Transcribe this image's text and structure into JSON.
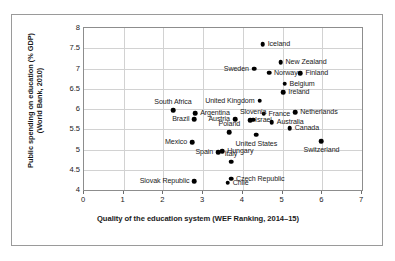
{
  "chart_data": {
    "type": "scatter",
    "title": "",
    "xlabel": "Quality of the education system (WEF Ranking, 2014–15)",
    "ylabel_line1": "Public spending on education (% GDP)",
    "ylabel_line2": "(World Bank, 2010)",
    "xlim": [
      0,
      7
    ],
    "ylim": [
      4,
      8
    ],
    "xticks": [
      "0",
      "1",
      "2",
      "3",
      "4",
      "5",
      "6",
      "7"
    ],
    "yticks": [
      "4",
      "4.5",
      "5",
      "5.5",
      "6",
      "6.5",
      "7",
      "7.5",
      "8"
    ],
    "grid": "both",
    "legend": "none",
    "point_color": "#000000",
    "points": [
      {
        "label": "Iceland",
        "x": 4.5,
        "y": 7.6,
        "pos": "right"
      },
      {
        "label": "Sweden",
        "x": 4.28,
        "y": 7.0,
        "pos": "left"
      },
      {
        "label": "New Zealand",
        "x": 4.95,
        "y": 7.15,
        "pos": "right"
      },
      {
        "label": "Norway",
        "x": 4.66,
        "y": 6.9,
        "pos": "right"
      },
      {
        "label": "Finland",
        "x": 5.45,
        "y": 6.88,
        "pos": "right"
      },
      {
        "label": "Belgium",
        "x": 5.05,
        "y": 6.62,
        "pos": "right"
      },
      {
        "label": "Ireland",
        "x": 5.02,
        "y": 6.42,
        "pos": "right"
      },
      {
        "label": "United Kingdom",
        "x": 4.42,
        "y": 6.2,
        "pos": "left"
      },
      {
        "label": "Netherlands",
        "x": 5.32,
        "y": 5.92,
        "pos": "right"
      },
      {
        "label": "France",
        "x": 4.52,
        "y": 5.88,
        "pos": "right"
      },
      {
        "label": "Slovenia",
        "x": 4.26,
        "y": 5.74,
        "pos": "above"
      },
      {
        "label": "South Africa",
        "x": 2.24,
        "y": 5.97,
        "pos": "above"
      },
      {
        "label": "Argentina",
        "x": 2.8,
        "y": 5.9,
        "pos": "right"
      },
      {
        "label": "Brazil",
        "x": 2.78,
        "y": 5.75,
        "pos": "left"
      },
      {
        "label": "Austria",
        "x": 3.8,
        "y": 5.75,
        "pos": "left"
      },
      {
        "label": "Israel",
        "x": 4.18,
        "y": 5.72,
        "pos": "right"
      },
      {
        "label": "Australia",
        "x": 4.73,
        "y": 5.68,
        "pos": "right"
      },
      {
        "label": "Canada",
        "x": 5.18,
        "y": 5.52,
        "pos": "right"
      },
      {
        "label": "Mexico",
        "x": 2.72,
        "y": 5.18,
        "pos": "left"
      },
      {
        "label": "Poland",
        "x": 3.66,
        "y": 5.42,
        "pos": "above"
      },
      {
        "label": "United States",
        "x": 4.34,
        "y": 5.37,
        "pos": "below"
      },
      {
        "label": "Switzerland",
        "x": 5.98,
        "y": 5.2,
        "pos": "below"
      },
      {
        "label": "Hungary",
        "x": 3.48,
        "y": 4.96,
        "pos": "right"
      },
      {
        "label": "Spain",
        "x": 3.38,
        "y": 4.93,
        "pos": "left"
      },
      {
        "label": "Italy",
        "x": 3.7,
        "y": 4.7,
        "pos": "above"
      },
      {
        "label": "Slovak Republic",
        "x": 2.78,
        "y": 4.22,
        "pos": "left"
      },
      {
        "label": "Czech Republic",
        "x": 3.7,
        "y": 4.28,
        "pos": "right"
      },
      {
        "label": "Chile",
        "x": 3.62,
        "y": 4.18,
        "pos": "right"
      }
    ]
  }
}
